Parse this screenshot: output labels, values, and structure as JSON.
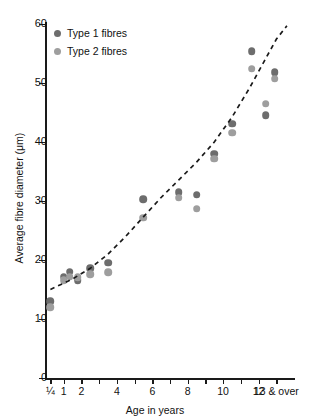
{
  "chart_data": {
    "type": "scatter",
    "title": "",
    "xlabel": "Age in years",
    "ylabel": "Average fibre diameter (μm)",
    "ylim": [
      0,
      60
    ],
    "xlim": [
      0,
      14
    ],
    "grid": false,
    "ytick_labels": [
      "0",
      "10",
      "20",
      "30",
      "40",
      "50",
      "60"
    ],
    "ytick_values": [
      0,
      10,
      20,
      30,
      40,
      50,
      60
    ],
    "xtick_labels": [
      "¼",
      "1",
      "2",
      "",
      "4",
      "",
      "6",
      "",
      "8",
      "",
      "10",
      "",
      "12",
      "13 & over"
    ],
    "xtick_values": [
      0.25,
      1,
      2,
      3,
      4,
      5,
      6,
      7,
      8,
      9,
      10,
      11,
      12,
      13
    ],
    "legend_position": "top-left",
    "series": [
      {
        "name": "Type 1 fibres",
        "color": "#6d6d6d",
        "points": [
          {
            "x": 0.25,
            "y": 13.0
          },
          {
            "x": 1.0,
            "y": 17.2
          },
          {
            "x": 1.35,
            "y": 18.0
          },
          {
            "x": 1.8,
            "y": 16.6
          },
          {
            "x": 2.5,
            "y": 18.6
          },
          {
            "x": 3.5,
            "y": 19.5
          },
          {
            "x": 5.5,
            "y": 30.3
          },
          {
            "x": 7.5,
            "y": 31.5
          },
          {
            "x": 8.5,
            "y": 31.1
          },
          {
            "x": 9.5,
            "y": 38.0
          },
          {
            "x": 10.5,
            "y": 43.1
          },
          {
            "x": 11.6,
            "y": 55.4
          },
          {
            "x": 12.4,
            "y": 44.5
          },
          {
            "x": 12.9,
            "y": 51.8
          }
        ]
      },
      {
        "name": "Type 2 fibres",
        "color": "#9e9e9e",
        "points": [
          {
            "x": 0.25,
            "y": 12.0
          },
          {
            "x": 1.0,
            "y": 16.6
          },
          {
            "x": 1.35,
            "y": 17.2
          },
          {
            "x": 1.8,
            "y": 17.1
          },
          {
            "x": 2.5,
            "y": 17.6
          },
          {
            "x": 3.5,
            "y": 17.9
          },
          {
            "x": 5.5,
            "y": 27.2
          },
          {
            "x": 7.5,
            "y": 30.6
          },
          {
            "x": 8.5,
            "y": 28.7
          },
          {
            "x": 9.5,
            "y": 37.2
          },
          {
            "x": 10.5,
            "y": 41.6
          },
          {
            "x": 11.6,
            "y": 52.4
          },
          {
            "x": 12.4,
            "y": 46.5
          },
          {
            "x": 12.9,
            "y": 50.7
          }
        ]
      }
    ],
    "trend": {
      "style": "dashed",
      "color": "#1a1a1a",
      "points": [
        {
          "x": 0.25,
          "y": 15.0
        },
        {
          "x": 1.5,
          "y": 16.8
        },
        {
          "x": 2.5,
          "y": 18.6
        },
        {
          "x": 3.5,
          "y": 21.0
        },
        {
          "x": 4.5,
          "y": 24.0
        },
        {
          "x": 5.5,
          "y": 27.3
        },
        {
          "x": 6.5,
          "y": 30.6
        },
        {
          "x": 7.5,
          "y": 33.6
        },
        {
          "x": 8.5,
          "y": 36.6
        },
        {
          "x": 9.5,
          "y": 40.0
        },
        {
          "x": 10.5,
          "y": 44.2
        },
        {
          "x": 11.5,
          "y": 49.2
        },
        {
          "x": 12.3,
          "y": 53.6
        },
        {
          "x": 13.0,
          "y": 57.4
        },
        {
          "x": 13.6,
          "y": 59.7
        }
      ]
    }
  },
  "legend": {
    "items": [
      {
        "label": "Type 1 fibres",
        "color": "#6d6d6d"
      },
      {
        "label": "Type 2 fibres",
        "color": "#9e9e9e"
      }
    ]
  }
}
